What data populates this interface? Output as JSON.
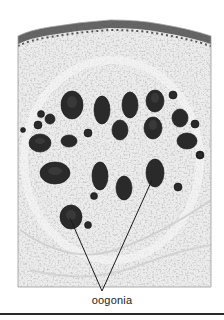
{
  "figure": {
    "label": "oogonia",
    "colors": {
      "background": "#ffffff",
      "tissue": "#e4e4e4",
      "tissue_dark": "#b8b8b8",
      "oogonia": "#2b2b2b",
      "epithelium": "#1e1e1e",
      "pointer": "#1a1a1a",
      "rule": "#2a2a2a"
    },
    "pointer_target": [
      70,
      303
    ],
    "pointer_ends": [
      [
        70,
        215
      ],
      [
        155,
        174
      ]
    ]
  }
}
